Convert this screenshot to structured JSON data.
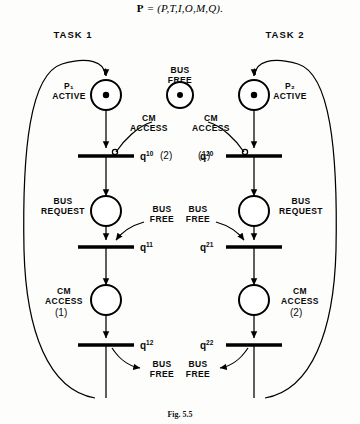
{
  "figure": {
    "formula_bold": "P",
    "formula_rest": " = (P,T,I,O,M,Q).",
    "caption": "Fig. 5.5"
  },
  "headers": {
    "task1": "TASK 1",
    "task2": "TASK 2"
  },
  "shared": {
    "bus_free": "BUS\nFREE"
  },
  "task1": {
    "places": [
      {
        "label": "P₁\nACTIVE",
        "tokens": 1
      },
      {
        "label": "BUS\nREQUEST",
        "tokens": 0
      },
      {
        "label": "CM\nACCESS",
        "count": "(1)",
        "tokens": 0
      }
    ],
    "transitions": [
      {
        "id": "q",
        "sup": "10",
        "arc_label": "CM\nACCESS",
        "arc_count": "(2)"
      },
      {
        "id": "q",
        "sup": "11",
        "arc_label": "BUS\nFREE"
      },
      {
        "id": "q",
        "sup": "12",
        "out_label": "BUS\nFREE"
      }
    ]
  },
  "task2": {
    "places": [
      {
        "label": "P₂\nACTIVE",
        "tokens": 1
      },
      {
        "label": "BUS\nREQUEST",
        "tokens": 0
      },
      {
        "label": "CM\nACCESS",
        "count": "(2)",
        "tokens": 0
      }
    ],
    "transitions": [
      {
        "id": "q",
        "sup": "20",
        "arc_label": "CM\nACCESS",
        "arc_count": "(1)"
      },
      {
        "id": "q",
        "sup": "21",
        "arc_label": "BUS\nFREE"
      },
      {
        "id": "q",
        "sup": "22",
        "out_label": "BUS\nFREE"
      }
    ]
  },
  "colors": {
    "ink": "#000000",
    "paper": "#fdfdfc"
  }
}
